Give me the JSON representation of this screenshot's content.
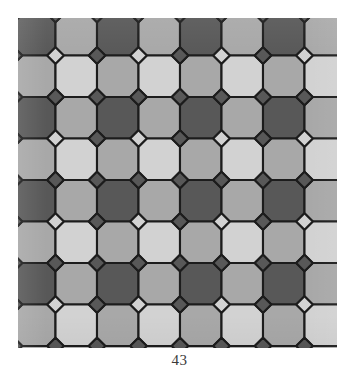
{
  "document": {
    "kind": "scanned-figure",
    "caption": "43",
    "page_background": "#ffffff"
  },
  "figure": {
    "name": "islamic-geometric-tiling",
    "panel": {
      "x": 18,
      "y": 18,
      "width": 319,
      "height": 330,
      "background_color": "#b4b4b4"
    },
    "palette": {
      "background": "#b4b4b4",
      "dark": "#585858",
      "mid": "#a8a8a8",
      "light": "#d2d2d2",
      "outline": "#1c1c1c"
    },
    "geometry": {
      "cell": 41.5,
      "cols": 8,
      "rows": 8,
      "origin_x": -4,
      "origin_y": -4,
      "stroke_width": 2.1,
      "cross_arm": 0.3,
      "cross_notch": 0.2
    },
    "tile_color_map": {
      "legend": "0 = light, 1 = mid, 2 = dark",
      "grid": [
        [
          2,
          1,
          2,
          1,
          2,
          1,
          2,
          1
        ],
        [
          1,
          0,
          1,
          0,
          1,
          0,
          1,
          0
        ],
        [
          2,
          1,
          2,
          1,
          2,
          1,
          2,
          1
        ],
        [
          1,
          0,
          1,
          0,
          1,
          0,
          1,
          0
        ],
        [
          2,
          1,
          2,
          1,
          2,
          1,
          2,
          1
        ],
        [
          1,
          0,
          1,
          0,
          1,
          0,
          1,
          0
        ],
        [
          2,
          1,
          2,
          1,
          2,
          1,
          2,
          1
        ],
        [
          1,
          0,
          1,
          0,
          1,
          0,
          1,
          0
        ]
      ]
    }
  },
  "chart_data": {
    "type": "table",
    "categories": [
      "dark-cross",
      "mid-cross",
      "light-cross",
      "star-interstice"
    ],
    "values": [
      32,
      32,
      32,
      49
    ],
    "xlabel": "",
    "ylabel": "",
    "annotations": [
      "43"
    ]
  }
}
